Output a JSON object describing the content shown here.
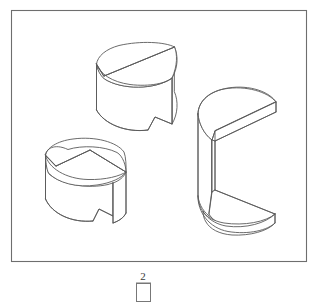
{
  "figure": {
    "caption_number": "2",
    "background_color": "#ffffff",
    "line_color": "#5a5a5a",
    "frame_color": "#6e6e6e",
    "canvas": {
      "width": 318,
      "height": 302
    }
  },
  "frame": {
    "name": "outer-border",
    "x": 11,
    "y": 10,
    "width": 296,
    "height": 252
  },
  "caption": {
    "number": "2",
    "number_x": 143,
    "number_y": 280,
    "box_x": 136,
    "box_y": 283,
    "box_width": 15,
    "box_height": 19
  },
  "solids": [
    {
      "id": "solid-top-left",
      "label": "Cylinder with angled half-cut and bottom V-notch",
      "description": "Upper-left pictorial: a cylinder whose upper portion is sliced by an inclined plane leaving a half-disc, with a wedge-shaped notch removed from the lower front.",
      "center_x": 131,
      "center_y": 90
    },
    {
      "id": "solid-bottom-left",
      "label": "Short cylinder with angled cut and keyway notch",
      "description": "Lower-left pictorial: a short cylinder with a sloping cut across the top face and a narrow vertical keyway slot cut through the front.",
      "center_x": 83,
      "center_y": 189
    },
    {
      "id": "solid-right",
      "label": "C-shaped solid with semicircular ends",
      "description": "Right pictorial: a tall C-channel solid with rounded semicircular top and bottom flanges joined by a vertical web at the back.",
      "center_x": 240,
      "center_y": 155
    }
  ]
}
